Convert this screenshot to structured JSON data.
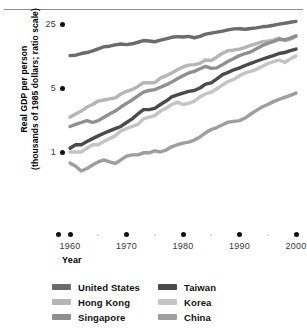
{
  "figure": {
    "top_stub_text": "",
    "y_axis_title_line1": "Real GDP per person",
    "y_axis_title_line2": "(thousands of 1985 dollars; ratio scale)",
    "x_axis_title": "Year"
  },
  "legend": {
    "left": [
      {
        "label": "United States",
        "color": "#6b6b6b"
      },
      {
        "label": "Hong Kong",
        "color": "#b5b5b5"
      },
      {
        "label": "Singapore",
        "color": "#8f8f8f"
      }
    ],
    "right": [
      {
        "label": "Taiwan",
        "color": "#4a4a4a"
      },
      {
        "label": "Korea",
        "color": "#c4c4c4"
      },
      {
        "label": "China",
        "color": "#9e9e9e"
      }
    ]
  },
  "chart_data": {
    "type": "line",
    "title": "",
    "xlabel": "Year",
    "ylabel": "Real GDP per person (thousands of 1985 dollars; ratio scale)",
    "yscale": "log",
    "ylim": [
      0.55,
      30
    ],
    "xlim": [
      1960,
      2000
    ],
    "ytick_labels": [
      "25",
      "5",
      "1"
    ],
    "ytick_values": [
      25,
      5,
      1
    ],
    "xtick_labels": [
      "1960",
      "1970",
      "1980",
      "1990",
      "2000"
    ],
    "xtick_values": [
      1960,
      1970,
      1980,
      1990,
      2000
    ],
    "xminor_values": [
      1965,
      1975,
      1985,
      1995
    ],
    "grid": false,
    "legend_position": "bottom",
    "x": [
      1960,
      1961,
      1962,
      1963,
      1964,
      1965,
      1966,
      1967,
      1968,
      1969,
      1970,
      1971,
      1972,
      1973,
      1974,
      1975,
      1976,
      1977,
      1978,
      1979,
      1980,
      1981,
      1982,
      1983,
      1984,
      1985,
      1986,
      1987,
      1988,
      1989,
      1990,
      1991,
      1992,
      1993,
      1994,
      1995,
      1996,
      1997,
      1998,
      1999,
      2000
    ],
    "series": [
      {
        "name": "United States",
        "color": "#6b6b6b",
        "values": [
          11.3,
          11.4,
          11.9,
          12.2,
          12.7,
          13.4,
          14.1,
          14.3,
          14.8,
          15.1,
          14.9,
          15.2,
          15.8,
          16.5,
          16.3,
          16.0,
          16.7,
          17.2,
          17.9,
          18.2,
          18.0,
          18.3,
          17.7,
          18.3,
          19.4,
          19.9,
          20.4,
          20.9,
          21.6,
          22.1,
          22.2,
          21.9,
          22.3,
          22.7,
          23.3,
          23.6,
          24.2,
          24.9,
          25.5,
          26.1,
          26.7
        ]
      },
      {
        "name": "Hong Kong",
        "color": "#b5b5b5",
        "values": [
          2.4,
          2.6,
          2.8,
          3.1,
          3.3,
          3.6,
          3.7,
          3.8,
          3.9,
          4.3,
          4.6,
          4.8,
          5.2,
          5.7,
          5.7,
          5.7,
          6.4,
          6.8,
          7.3,
          7.9,
          8.5,
          8.9,
          9.0,
          9.3,
          10.1,
          10.0,
          10.9,
          12.0,
          12.8,
          13.0,
          13.3,
          13.9,
          14.6,
          15.3,
          16.0,
          16.2,
          16.7,
          17.5,
          16.5,
          17.0,
          18.3
        ]
      },
      {
        "name": "Singapore",
        "color": "#8f8f8f",
        "values": [
          1.9,
          2.0,
          2.1,
          2.2,
          2.1,
          2.2,
          2.4,
          2.6,
          2.8,
          3.1,
          3.4,
          3.7,
          4.1,
          4.5,
          4.7,
          4.8,
          5.1,
          5.4,
          5.8,
          6.3,
          6.8,
          7.3,
          7.6,
          8.1,
          8.6,
          8.2,
          8.3,
          9.0,
          9.8,
          10.5,
          11.3,
          11.9,
          12.4,
          13.4,
          14.5,
          15.3,
          16.1,
          17.0,
          16.8,
          17.5,
          18.6
        ]
      },
      {
        "name": "Taiwan",
        "color": "#4a4a4a",
        "values": [
          1.1,
          1.2,
          1.2,
          1.3,
          1.4,
          1.5,
          1.6,
          1.7,
          1.8,
          1.9,
          2.1,
          2.3,
          2.6,
          2.9,
          2.9,
          3.0,
          3.3,
          3.6,
          4.0,
          4.2,
          4.4,
          4.6,
          4.7,
          5.0,
          5.5,
          5.7,
          6.3,
          7.0,
          7.4,
          7.9,
          8.3,
          8.8,
          9.3,
          9.8,
          10.3,
          10.8,
          11.3,
          11.9,
          12.2,
          12.8,
          13.3
        ]
      },
      {
        "name": "Korea",
        "color": "#c4c4c4",
        "values": [
          1.0,
          1.0,
          1.0,
          1.1,
          1.2,
          1.2,
          1.3,
          1.4,
          1.5,
          1.7,
          1.8,
          1.9,
          2.0,
          2.3,
          2.4,
          2.5,
          2.8,
          3.0,
          3.3,
          3.5,
          3.3,
          3.4,
          3.6,
          4.0,
          4.3,
          4.5,
          4.9,
          5.4,
          5.9,
          6.2,
          6.8,
          7.3,
          7.6,
          8.0,
          8.6,
          9.2,
          9.7,
          10.1,
          9.5,
          10.4,
          11.2
        ]
      },
      {
        "name": "China",
        "color": "#9e9e9e",
        "values": [
          0.76,
          0.7,
          0.62,
          0.66,
          0.72,
          0.78,
          0.82,
          0.78,
          0.75,
          0.82,
          0.9,
          0.93,
          0.93,
          0.98,
          0.98,
          1.03,
          1.0,
          1.05,
          1.14,
          1.2,
          1.25,
          1.28,
          1.35,
          1.46,
          1.62,
          1.76,
          1.85,
          1.98,
          2.12,
          2.16,
          2.2,
          2.35,
          2.6,
          2.85,
          3.1,
          3.3,
          3.55,
          3.75,
          3.95,
          4.15,
          4.4
        ]
      }
    ]
  }
}
